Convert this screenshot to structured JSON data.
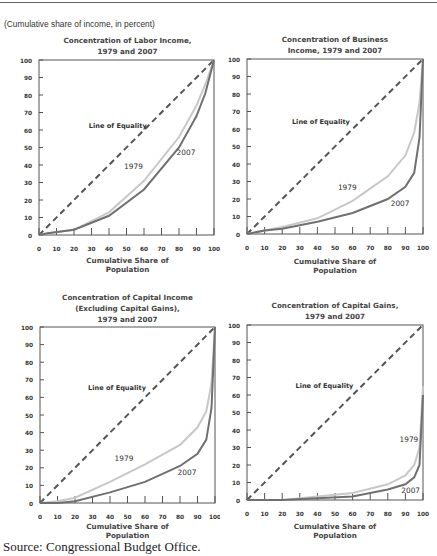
{
  "header": {
    "unit_note": "(Cumulative share of income, in percent)"
  },
  "source": "Source: Congressional Budget Office.",
  "colors": {
    "line_1979": "#c8c8c8",
    "line_2007": "#707070",
    "equality": "#555555",
    "axis": "#555555"
  },
  "chart_data": [
    {
      "type": "line",
      "title": "Concentration of Labor Income, 1979 and 2007",
      "title_lines": [
        "Concentration of Labor Income,",
        "1979 and 2007"
      ],
      "xlabel": "Cumulative Share of Population",
      "xlabel_lines": [
        "Cumulative Share of",
        "Population"
      ],
      "ylabel": "",
      "xlim": [
        0,
        100
      ],
      "ylim": [
        0,
        100
      ],
      "xticks": [
        0,
        10,
        20,
        30,
        40,
        50,
        60,
        70,
        80,
        90,
        100
      ],
      "yticks": [
        0,
        10,
        20,
        30,
        40,
        50,
        60,
        70,
        80,
        90,
        100
      ],
      "annotations": [
        {
          "text": "Line of Equality",
          "x": 45,
          "y": 61
        },
        {
          "text": "1979",
          "x": 54,
          "y": 38
        },
        {
          "text": "2007",
          "x": 84,
          "y": 46
        }
      ],
      "series": [
        {
          "name": "Line of Equality",
          "x": [
            0,
            100
          ],
          "y": [
            0,
            100
          ]
        },
        {
          "name": "1979",
          "x": [
            0,
            5,
            20,
            40,
            60,
            80,
            90,
            95,
            100
          ],
          "y": [
            0,
            1,
            3,
            13,
            31,
            56,
            74,
            86,
            100
          ]
        },
        {
          "name": "2007",
          "x": [
            0,
            5,
            20,
            40,
            60,
            80,
            90,
            95,
            100
          ],
          "y": [
            0,
            1,
            3,
            11,
            26,
            50,
            68,
            81,
            100
          ]
        }
      ]
    },
    {
      "type": "line",
      "title": "Concentration of Business Income, 1979 and 2007",
      "title_lines": [
        "Concentration of Business",
        "Income, 1979 and 2007"
      ],
      "xlabel": "Cumulative Share of Population",
      "xlabel_lines": [
        "Cumulative Share of",
        "Population"
      ],
      "ylabel": "",
      "xlim": [
        0,
        100
      ],
      "ylim": [
        0,
        100
      ],
      "xticks": [
        0,
        10,
        20,
        30,
        40,
        50,
        60,
        70,
        80,
        90,
        100
      ],
      "yticks": [
        0,
        10,
        20,
        30,
        40,
        50,
        60,
        70,
        80,
        90,
        100
      ],
      "annotations": [
        {
          "text": "Line of Equality",
          "x": 42,
          "y": 63
        },
        {
          "text": "1979",
          "x": 57,
          "y": 25
        },
        {
          "text": "2007",
          "x": 87,
          "y": 16
        }
      ],
      "series": [
        {
          "name": "Line of Equality",
          "x": [
            0,
            100
          ],
          "y": [
            0,
            100
          ]
        },
        {
          "name": "1979",
          "x": [
            0,
            10,
            20,
            40,
            60,
            80,
            90,
            95,
            98,
            100
          ],
          "y": [
            0,
            2,
            4,
            9,
            19,
            33,
            45,
            58,
            75,
            100
          ]
        },
        {
          "name": "2007",
          "x": [
            0,
            10,
            20,
            40,
            60,
            80,
            90,
            95,
            98,
            100
          ],
          "y": [
            0,
            2,
            3,
            7,
            12,
            20,
            27,
            35,
            55,
            100
          ]
        }
      ]
    },
    {
      "type": "line",
      "title": "Concentration of Capital Income (Excluding Capital Gains), 1979 and 2007",
      "title_lines": [
        "Concentration of Capital Income",
        "(Excluding Capital Gains),",
        "1979 and 2007"
      ],
      "xlabel": "Cumulative Share of Population",
      "xlabel_lines": [
        "Cumulative Share of",
        "Population"
      ],
      "ylabel": "",
      "xlim": [
        0,
        100
      ],
      "ylim": [
        0,
        100
      ],
      "xticks": [
        0,
        10,
        20,
        30,
        40,
        50,
        60,
        70,
        80,
        90,
        100
      ],
      "yticks": [
        0,
        10,
        20,
        30,
        40,
        50,
        60,
        70,
        80,
        90,
        100
      ],
      "annotations": [
        {
          "text": "Line of Equality",
          "x": 44,
          "y": 64
        },
        {
          "text": "1979",
          "x": 48,
          "y": 24
        },
        {
          "text": "2007",
          "x": 84,
          "y": 16
        }
      ],
      "series": [
        {
          "name": "Line of Equality",
          "x": [
            0,
            100
          ],
          "y": [
            0,
            100
          ]
        },
        {
          "name": "1979",
          "x": [
            0,
            10,
            20,
            40,
            60,
            80,
            90,
            95,
            98,
            100
          ],
          "y": [
            0,
            1,
            3,
            12,
            22,
            33,
            43,
            52,
            68,
            100
          ]
        },
        {
          "name": "2007",
          "x": [
            0,
            10,
            20,
            40,
            60,
            80,
            90,
            95,
            98,
            100
          ],
          "y": [
            0,
            0,
            1,
            6,
            12,
            21,
            28,
            36,
            54,
            100
          ]
        }
      ]
    },
    {
      "type": "line",
      "title": "Concentration of Capital Gains, 1979 and 2007",
      "title_lines": [
        "Concentration of Capital Gains,",
        "1979 and 2007"
      ],
      "xlabel": "Cumulative Share of Population",
      "xlabel_lines": [
        "Cumulative Share of",
        "Population"
      ],
      "ylabel": "",
      "xlim": [
        0,
        100
      ],
      "ylim": [
        0,
        100
      ],
      "xticks": [
        0,
        10,
        20,
        30,
        40,
        50,
        60,
        70,
        80,
        90,
        100
      ],
      "yticks": [
        0,
        10,
        20,
        30,
        40,
        50,
        60,
        70,
        80,
        90,
        100
      ],
      "annotations": [
        {
          "text": "Line of Equality",
          "x": 44,
          "y": 64
        },
        {
          "text": "1979",
          "x": 92,
          "y": 33
        },
        {
          "text": "2007",
          "x": 93,
          "y": 4
        }
      ],
      "series": [
        {
          "name": "Line of Equality",
          "x": [
            0,
            100
          ],
          "y": [
            0,
            100
          ]
        },
        {
          "name": "1979",
          "x": [
            0,
            20,
            40,
            60,
            80,
            90,
            95,
            98,
            100
          ],
          "y": [
            0,
            0,
            2,
            4,
            9,
            14,
            20,
            30,
            65
          ]
        },
        {
          "name": "2007",
          "x": [
            0,
            20,
            40,
            60,
            80,
            90,
            95,
            98,
            100
          ],
          "y": [
            0,
            0,
            1,
            2,
            6,
            9,
            13,
            20,
            60
          ]
        }
      ]
    }
  ]
}
